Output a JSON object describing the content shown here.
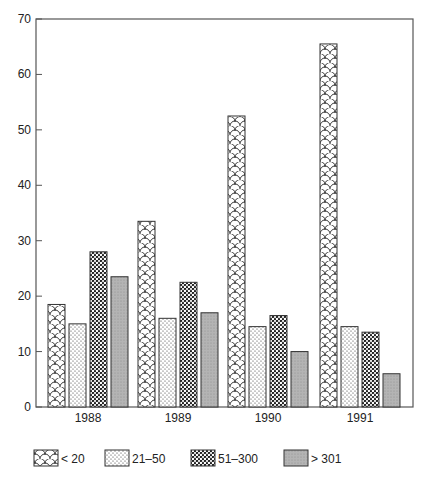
{
  "chart_data": {
    "type": "bar",
    "title": "",
    "xlabel": "",
    "ylabel": "",
    "categories": [
      "1988",
      "1989",
      "1990",
      "1991"
    ],
    "series": [
      {
        "name": "< 20",
        "pattern": "scales",
        "values": [
          18.5,
          33.5,
          52.5,
          65.5
        ]
      },
      {
        "name": "21–50",
        "pattern": "fine-dots",
        "values": [
          15,
          16,
          14.5,
          14.5
        ]
      },
      {
        "name": "51–300",
        "pattern": "dense-dots",
        "values": [
          28,
          22.5,
          16.5,
          13.5
        ]
      },
      {
        "name": "> 301",
        "pattern": "gray-fill",
        "values": [
          23.5,
          17,
          10,
          6
        ]
      }
    ],
    "ylim": [
      0,
      70
    ],
    "yticks": [
      0,
      10,
      20,
      30,
      40,
      50,
      60,
      70
    ],
    "grid": false,
    "legend_position": "bottom"
  },
  "colors": {
    "axis": "#555555",
    "bar_stroke": "#333333",
    "gray_fill": "#a8a8a8"
  }
}
